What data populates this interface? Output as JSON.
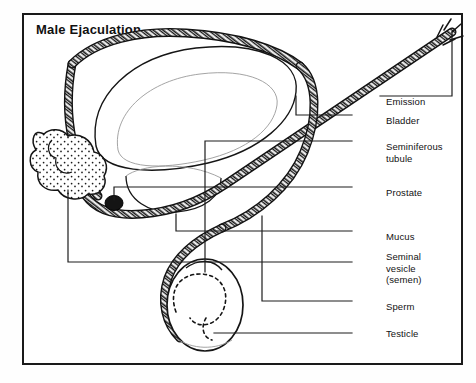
{
  "figure": {
    "title": "Male Ejaculation",
    "kind": "anatomical-line-diagram",
    "style": "black ink line drawing on white, boxed frame, leader lines to right-hand labels",
    "colors": {
      "ink": "#111111",
      "background": "#ffffff",
      "frame": "#1a1a1a",
      "leader": "#1d1d1d"
    }
  },
  "labels": [
    {
      "id": "emission",
      "text": "Emission",
      "x": 386,
      "y": 96
    },
    {
      "id": "bladder",
      "text": "Bladder",
      "x": 386,
      "y": 115
    },
    {
      "id": "seminiferous",
      "text": "Seminiferous\ntubule",
      "x": 386,
      "y": 141
    },
    {
      "id": "prostate",
      "text": "Prostate",
      "x": 386,
      "y": 187
    },
    {
      "id": "mucus",
      "text": "Mucus",
      "x": 386,
      "y": 231
    },
    {
      "id": "seminal-vesicle",
      "text": "Seminal\nvesicle\n(semen)",
      "x": 386,
      "y": 251
    },
    {
      "id": "sperm",
      "text": "Sperm",
      "x": 386,
      "y": 301
    },
    {
      "id": "testicle",
      "text": "Testicle",
      "x": 386,
      "y": 328
    }
  ],
  "parts": [
    {
      "id": "bladder",
      "name": "bladder",
      "note": "large ovoid upper-left organ"
    },
    {
      "id": "seminal-vesicle",
      "name": "seminal vesicle",
      "note": "lobed stippled sac, far left"
    },
    {
      "id": "prostate",
      "name": "prostate",
      "note": "dark nodule at duct junction"
    },
    {
      "id": "vas-deferens",
      "name": "vas deferens / urethra",
      "note": "hatched double-walled tube"
    },
    {
      "id": "testicle",
      "name": "testicle",
      "note": "oval at lower middle"
    },
    {
      "id": "seminiferous",
      "name": "seminiferous tubule",
      "note": "dotted coil inside testicle"
    },
    {
      "id": "emission",
      "name": "emission",
      "note": "spray at urethral tip, upper right"
    }
  ]
}
